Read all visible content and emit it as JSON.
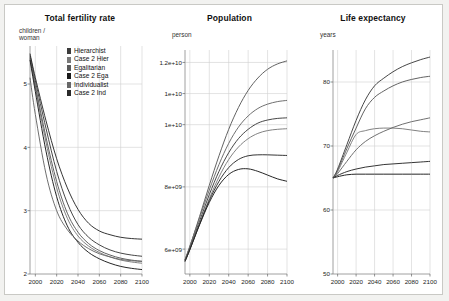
{
  "figure": {
    "background": "#ffffff",
    "border_color": "#c9c9c5",
    "page_background": "#f2f2f0"
  },
  "legend": {
    "position": "top-right-of-first-panel",
    "entries": [
      {
        "label": "Hierarchist",
        "color": "#3c3c3c"
      },
      {
        "label": "Case 2 Hier",
        "color": "#7a7a7a"
      },
      {
        "label": "Egalitarian",
        "color": "#5a5a5a"
      },
      {
        "label": "Case 2 Ega",
        "color": "#1a1a1a"
      },
      {
        "label": "Individualist",
        "color": "#676767"
      },
      {
        "label": "Case 2 Ind",
        "color": "#2a2a2a"
      }
    ]
  },
  "chart_data": [
    {
      "type": "line",
      "title": "Total fertility rate",
      "ylabel": "children /\nwoman",
      "xlabel": "",
      "xlim": [
        1995,
        2100
      ],
      "ylim": [
        2,
        5.6
      ],
      "yticks": [
        2,
        3,
        4,
        5
      ],
      "ytick_labels": [
        "2",
        "3",
        "4",
        "5"
      ],
      "xticks": [
        2000,
        2020,
        2040,
        2060,
        2080,
        2100
      ],
      "xtick_labels": [
        "2000",
        "2020",
        "2040",
        "2060",
        "2080",
        "2100"
      ],
      "grid": true,
      "x": [
        1995,
        2000,
        2010,
        2020,
        2030,
        2040,
        2050,
        2060,
        2070,
        2080,
        2090,
        2100
      ],
      "series": [
        {
          "name": "Hierarchist",
          "color": "#3c3c3c",
          "values": [
            5.45,
            5.05,
            4.3,
            3.62,
            3.12,
            2.78,
            2.58,
            2.46,
            2.38,
            2.33,
            2.3,
            2.28
          ]
        },
        {
          "name": "Case 2 Hier",
          "color": "#7a7a7a",
          "values": [
            5.4,
            4.95,
            4.08,
            3.36,
            2.88,
            2.6,
            2.44,
            2.34,
            2.27,
            2.22,
            2.19,
            2.17
          ]
        },
        {
          "name": "Egalitarian",
          "color": "#5a5a5a",
          "values": [
            5.42,
            4.98,
            4.16,
            3.46,
            2.96,
            2.66,
            2.48,
            2.37,
            2.3,
            2.25,
            2.22,
            2.2
          ]
        },
        {
          "name": "Case 2 Ega",
          "color": "#1a1a1a",
          "values": [
            5.38,
            4.88,
            3.94,
            3.22,
            2.76,
            2.5,
            2.34,
            2.24,
            2.17,
            2.12,
            2.09,
            2.07
          ]
        },
        {
          "name": "Individualist",
          "color": "#676767",
          "values": [
            5.1,
            4.52,
            3.58,
            3.0,
            2.7,
            2.52,
            2.4,
            2.32,
            2.27,
            2.23,
            2.21,
            2.2
          ]
        },
        {
          "name": "Case 2 Ind",
          "color": "#2a2a2a",
          "values": [
            5.48,
            5.1,
            4.42,
            3.82,
            3.36,
            3.02,
            2.8,
            2.68,
            2.62,
            2.58,
            2.56,
            2.55
          ]
        }
      ]
    },
    {
      "type": "line",
      "title": "Population",
      "ylabel": "person",
      "xlabel": "",
      "xlim": [
        1995,
        2100
      ],
      "ylim": [
        5200000000,
        12400000000
      ],
      "yticks": [
        6000000000,
        8000000000,
        10000000000,
        11000000000,
        12000000000
      ],
      "ytick_labels": [
        "6e+09",
        "8e+09",
        "1e+10",
        "1e+10",
        "1.2e+10"
      ],
      "xticks": [
        2000,
        2020,
        2040,
        2060,
        2080,
        2100
      ],
      "xtick_labels": [
        "2000",
        "2020",
        "2040",
        "2060",
        "2080",
        "2100"
      ],
      "grid": true,
      "x": [
        1995,
        2000,
        2010,
        2020,
        2030,
        2040,
        2050,
        2060,
        2070,
        2080,
        2090,
        2100
      ],
      "series": [
        {
          "name": "Hierarchist",
          "color": "#3c3c3c",
          "values": [
            5650000000,
            6050000000,
            6900000000,
            7750000000,
            8500000000,
            9100000000,
            9550000000,
            9850000000,
            10050000000,
            10150000000,
            10200000000,
            10220000000
          ]
        },
        {
          "name": "Case 2 Hier",
          "color": "#7a7a7a",
          "values": [
            5620000000,
            6000000000,
            6820000000,
            7620000000,
            8320000000,
            8880000000,
            9280000000,
            9550000000,
            9720000000,
            9810000000,
            9850000000,
            9870000000
          ]
        },
        {
          "name": "Egalitarian",
          "color": "#5a5a5a",
          "values": [
            5640000000,
            6080000000,
            7050000000,
            8050000000,
            9000000000,
            9850000000,
            10550000000,
            11100000000,
            11500000000,
            11780000000,
            11950000000,
            12050000000
          ]
        },
        {
          "name": "Case 2 Ega",
          "color": "#1a1a1a",
          "values": [
            5600000000,
            5980000000,
            6780000000,
            7500000000,
            8050000000,
            8400000000,
            8560000000,
            8580000000,
            8500000000,
            8380000000,
            8260000000,
            8180000000
          ]
        },
        {
          "name": "Individualist",
          "color": "#676767",
          "values": [
            5660000000,
            6100000000,
            7000000000,
            7900000000,
            8720000000,
            9400000000,
            9920000000,
            10280000000,
            10520000000,
            10660000000,
            10740000000,
            10780000000
          ]
        },
        {
          "name": "Case 2 Ind",
          "color": "#2a2a2a",
          "values": [
            5610000000,
            5990000000,
            6800000000,
            7560000000,
            8180000000,
            8620000000,
            8880000000,
            9000000000,
            9030000000,
            9030000000,
            9020000000,
            9010000000
          ]
        }
      ]
    },
    {
      "type": "line",
      "title": "Life expectancy",
      "ylabel": "years",
      "xlabel": "",
      "xlim": [
        1995,
        2100
      ],
      "ylim": [
        50,
        85
      ],
      "yticks": [
        50,
        60,
        70,
        80
      ],
      "ytick_labels": [
        "50",
        "60",
        "70",
        "80"
      ],
      "xticks": [
        2000,
        2020,
        2040,
        2060,
        2080,
        2100
      ],
      "xtick_labels": [
        "2000",
        "2020",
        "2040",
        "2060",
        "2080",
        "2100"
      ],
      "grid": true,
      "x": [
        1995,
        2000,
        2010,
        2020,
        2030,
        2040,
        2050,
        2060,
        2070,
        2080,
        2090,
        2100
      ],
      "series": [
        {
          "name": "Hierarchist",
          "color": "#3c3c3c",
          "values": [
            65.0,
            66.4,
            70.2,
            74.0,
            77.2,
            79.4,
            80.6,
            81.6,
            82.4,
            83.0,
            83.5,
            83.9
          ]
        },
        {
          "name": "Case 2 Hier",
          "color": "#7a7a7a",
          "values": [
            65.0,
            66.0,
            69.0,
            71.8,
            72.4,
            72.7,
            72.8,
            72.8,
            72.7,
            72.5,
            72.3,
            72.2
          ]
        },
        {
          "name": "Egalitarian",
          "color": "#5a5a5a",
          "values": [
            65.0,
            66.2,
            69.6,
            72.8,
            75.8,
            77.6,
            78.6,
            79.4,
            80.0,
            80.4,
            80.7,
            80.9
          ]
        },
        {
          "name": "Case 2 Ega",
          "color": "#1a1a1a",
          "values": [
            65.0,
            65.2,
            65.5,
            65.6,
            65.6,
            65.6,
            65.6,
            65.6,
            65.6,
            65.6,
            65.6,
            65.6
          ]
        },
        {
          "name": "Individualist",
          "color": "#676767",
          "values": [
            65.0,
            65.7,
            67.6,
            69.4,
            70.7,
            71.6,
            72.3,
            72.9,
            73.4,
            73.8,
            74.1,
            74.4
          ]
        },
        {
          "name": "Case 2 Ind",
          "color": "#2a2a2a",
          "values": [
            65.0,
            65.4,
            66.0,
            66.4,
            66.7,
            66.9,
            67.1,
            67.2,
            67.3,
            67.4,
            67.5,
            67.6
          ]
        }
      ]
    }
  ]
}
